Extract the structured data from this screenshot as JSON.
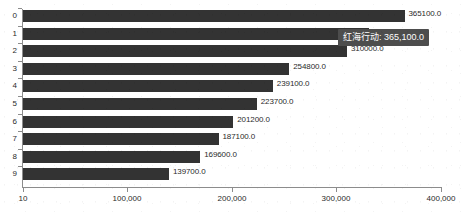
{
  "chart_data": {
    "type": "bar",
    "orientation": "horizontal",
    "title": "",
    "xlabel": "",
    "ylabel": "",
    "grid": false,
    "legend": "none",
    "categories": [
      "0",
      "1",
      "2",
      "3",
      "4",
      "5",
      "6",
      "7",
      "8",
      "9"
    ],
    "values": [
      365100.0,
      331000.0,
      310000.0,
      254800.0,
      239100.0,
      223700.0,
      201200.0,
      187100.0,
      169600.0,
      139700.0
    ],
    "value_labels": [
      "365100.0",
      "331000.0",
      "310000.0",
      "254800.0",
      "239100.0",
      "223700.0",
      "201200.0",
      "187100.0",
      "169600.0",
      "139700.0"
    ],
    "bar_color": "#333333",
    "xlim": [
      10,
      400000
    ],
    "xticks": [
      10,
      100000,
      200000,
      300000,
      400000
    ],
    "xtick_labels": [
      "10",
      "100,000",
      "200,000",
      "300,000",
      "400,000"
    ],
    "ytick_labels": [
      "0",
      "1",
      "2",
      "3",
      "4",
      "5",
      "6",
      "7",
      "8",
      "9"
    ]
  },
  "tooltip": {
    "visible": true,
    "series_name": "红海行动",
    "separator": ": ",
    "value": "365,100.0",
    "background_color": "#4d4d4d",
    "text_color": "#ffffff"
  },
  "axes": {
    "axis_color": "#8c8c8c",
    "tick_label_color": "#2b2b2b"
  }
}
